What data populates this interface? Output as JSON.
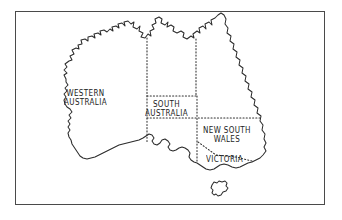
{
  "figure": {
    "kind": "map",
    "region": "Australia",
    "frame_border_color": "#4a4a4a",
    "background_color": "#ffffff",
    "coastline_color": "#2b2b2b",
    "state_border_color": "#2f2f2f",
    "state_border_style": "dotted",
    "label_color": "#1c1c1c"
  },
  "labels": {
    "western_australia": {
      "line1": "WESTERN",
      "line2": "AUSTRALIA"
    },
    "south_australia": {
      "line1": "SOUTH",
      "line2": "AUSTRALIA"
    },
    "new_south_wales": {
      "line1": "NEW SOUTH",
      "line2": "WALES"
    },
    "victoria": {
      "line1": "VICTORIA"
    }
  },
  "map_data": {
    "type": "outline-map",
    "labeled_states": [
      "WESTERN AUSTRALIA",
      "SOUTH AUSTRALIA",
      "NEW SOUTH WALES",
      "VICTORIA"
    ],
    "unlabeled_regions": 2,
    "islands": 1
  }
}
